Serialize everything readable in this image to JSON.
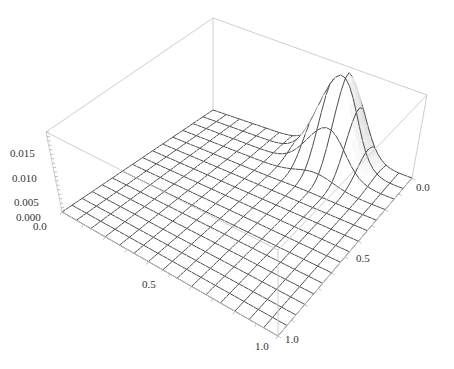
{
  "chart_data": {
    "type": "surface3d",
    "title": "",
    "xlabel": "",
    "ylabel": "",
    "zlabel": "",
    "x_ticks": [
      "0.0",
      "0.5",
      "1.0"
    ],
    "y_ticks": [
      "0.0",
      "0.5",
      "1.0"
    ],
    "z_ticks": [
      "0.000",
      "0.005",
      "0.010",
      "0.015"
    ],
    "xlim": [
      0,
      1
    ],
    "ylim": [
      0,
      1
    ],
    "zlim": [
      0,
      0.018
    ],
    "mesh_divisions": 15,
    "surface": {
      "shape": "single gaussian peak, elsewhere ~0",
      "peak_x": 0.05,
      "peak_y": 0.35,
      "peak_z": 0.019,
      "sigma_x": 0.07,
      "sigma_y": 0.09
    },
    "colors": {
      "surface": "#ffffff",
      "mesh": "#3a3a3a",
      "box": "#c8c8c8",
      "text": "#333333"
    }
  },
  "labels": {
    "z_0": "0.000",
    "z_1": "0.005",
    "z_2": "0.010",
    "z_3": "0.015",
    "x_0": "0.0",
    "x_mid": "0.5",
    "x_1": "1.0",
    "y_0": "0.0",
    "y_mid": "0.5",
    "y_1": "1.0"
  }
}
